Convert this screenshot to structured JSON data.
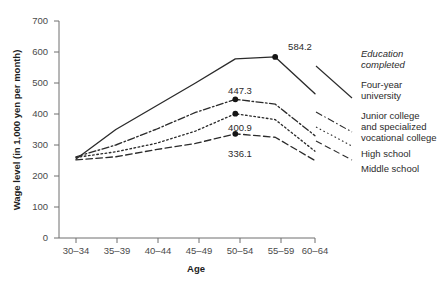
{
  "chart_data": {
    "type": "line",
    "title": "",
    "xlabel": "Age",
    "ylabel": "Wage level (in 1,000 yen per month)",
    "categories": [
      "30–34",
      "35–39",
      "40–44",
      "45–49",
      "50–54",
      "55–59",
      "60–64"
    ],
    "ylim": [
      0,
      700
    ],
    "yticks": [
      0,
      100,
      200,
      300,
      400,
      500,
      600,
      700
    ],
    "grid": false,
    "legend_position": "right",
    "legend_heading": "Education\ncompleted",
    "series": [
      {
        "name": "Four-year university",
        "style": "solid",
        "values": [
          255.0,
          350.0,
          425.0,
          500.0,
          578.0,
          584.2,
          465.0
        ],
        "labeled_points": [
          {
            "category": "55–59",
            "value": 584.2,
            "label": "584.2"
          }
        ]
      },
      {
        "name": "Junior college and specialized vocational college",
        "style": "dash-dot",
        "values": [
          262.0,
          300.0,
          350.0,
          405.0,
          447.3,
          432.0,
          330.0
        ],
        "labeled_points": [
          {
            "category": "50–54",
            "value": 447.3,
            "label": "447.3"
          }
        ]
      },
      {
        "name": "High school",
        "style": "dotted",
        "values": [
          260.0,
          278.0,
          305.0,
          345.0,
          400.9,
          382.0,
          280.0
        ],
        "labeled_points": [
          {
            "category": "50–54",
            "value": 400.9,
            "label": "400.9"
          }
        ]
      },
      {
        "name": "Middle school",
        "style": "dashed",
        "values": [
          252.0,
          262.0,
          285.0,
          305.0,
          336.1,
          325.0,
          250.0
        ],
        "labeled_points": [
          {
            "category": "50–54",
            "value": 336.1,
            "label": "336.1"
          }
        ]
      }
    ]
  },
  "axes": {
    "y_title": "Wage level (in 1,000 yen per month)",
    "x_title": "Age",
    "y_tick_labels": [
      "700",
      "600",
      "500",
      "400",
      "300",
      "200",
      "100",
      "0"
    ],
    "x_tick_labels": [
      "30–34",
      "35–39",
      "40–44",
      "45–49",
      "50–54",
      "55–59",
      "60–64"
    ]
  },
  "data_labels": {
    "university_peak": "584.2",
    "junior_college_peak": "447.3",
    "high_school_peak": "400.9",
    "middle_school_peak": "336.1"
  },
  "legend": {
    "heading_line1": "Education",
    "heading_line2": "completed",
    "items": [
      {
        "lines": [
          "Four-year",
          "university"
        ]
      },
      {
        "lines": [
          "Junior college",
          "and specialized",
          "vocational college"
        ]
      },
      {
        "lines": [
          "High school"
        ]
      },
      {
        "lines": [
          "Middle school"
        ]
      }
    ]
  },
  "colors": {
    "line": "#2b2b2b",
    "axis": "#6f6f6f",
    "text": "#2b2b2b",
    "background": "#ffffff"
  }
}
